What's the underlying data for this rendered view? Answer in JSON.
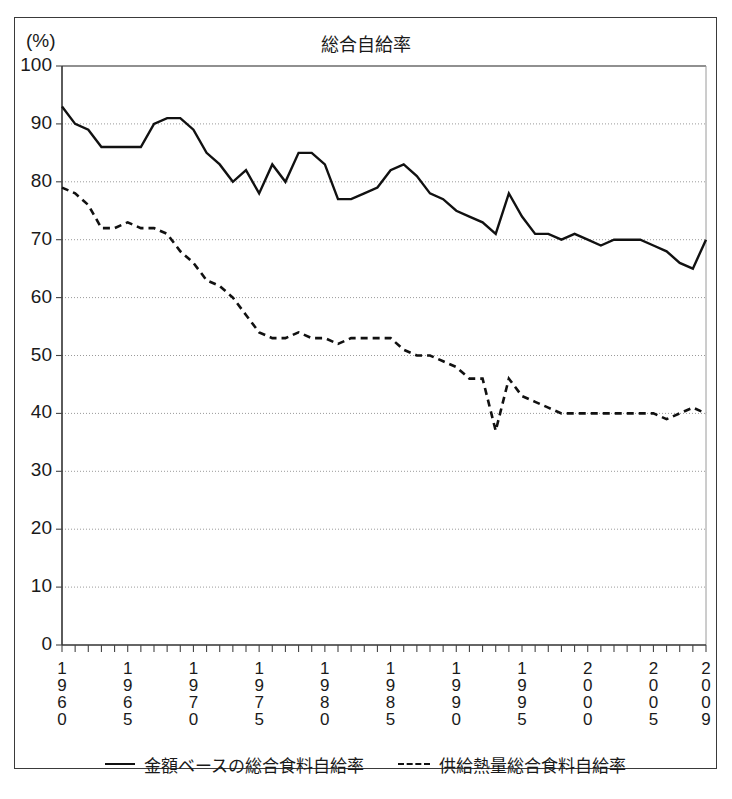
{
  "unit_label": "(%)",
  "title": "総合自給率",
  "legend": [
    {
      "label": "金額ベースの総合食料自給率",
      "style": "solid",
      "name": "legend-value-based"
    },
    {
      "label": "供給熱量総合食料自給率",
      "style": "dashed",
      "name": "legend-calorie-based"
    }
  ],
  "chart_data": {
    "type": "line",
    "title": "総合自給率",
    "xlabel": "",
    "ylabel": "(%)",
    "ylim": [
      0,
      100
    ],
    "xlim": [
      1960,
      2009
    ],
    "yticks": [
      0,
      10,
      20,
      30,
      40,
      50,
      60,
      70,
      80,
      90,
      100
    ],
    "xticks": [
      1960,
      1965,
      1970,
      1975,
      1980,
      1985,
      1990,
      1995,
      2000,
      2005,
      2009
    ],
    "xtick_labels": [
      "1960",
      "1965",
      "1970",
      "1975",
      "1980",
      "1985",
      "1990",
      "1995",
      "2000",
      "2005",
      "2009"
    ],
    "grid": "horizontal-dotted",
    "legend_position": "bottom",
    "x": [
      1960,
      1961,
      1962,
      1963,
      1964,
      1965,
      1966,
      1967,
      1968,
      1969,
      1970,
      1971,
      1972,
      1973,
      1974,
      1975,
      1976,
      1977,
      1978,
      1979,
      1980,
      1981,
      1982,
      1983,
      1984,
      1985,
      1986,
      1987,
      1988,
      1989,
      1990,
      1991,
      1992,
      1993,
      1994,
      1995,
      1996,
      1997,
      1998,
      1999,
      2000,
      2001,
      2002,
      2003,
      2004,
      2005,
      2006,
      2007,
      2008,
      2009
    ],
    "series": [
      {
        "name": "金額ベースの総合食料自給率",
        "style": "solid",
        "values": [
          93,
          90,
          89,
          86,
          86,
          86,
          86,
          90,
          91,
          91,
          89,
          85,
          83,
          80,
          82,
          78,
          83,
          80,
          85,
          85,
          83,
          77,
          77,
          78,
          79,
          82,
          83,
          81,
          78,
          77,
          75,
          74,
          73,
          71,
          78,
          74,
          71,
          71,
          70,
          71,
          70,
          69,
          70,
          70,
          70,
          69,
          68,
          66,
          65,
          70
        ]
      },
      {
        "name": "供給熱量総合食料自給率",
        "style": "dashed",
        "values": [
          79,
          78,
          76,
          72,
          72,
          73,
          72,
          72,
          71,
          68,
          66,
          63,
          62,
          60,
          57,
          54,
          53,
          53,
          54,
          53,
          53,
          52,
          53,
          53,
          53,
          53,
          51,
          50,
          50,
          49,
          48,
          46,
          46,
          37,
          46,
          43,
          42,
          41,
          40,
          40,
          40,
          40,
          40,
          40,
          40,
          40,
          39,
          40,
          41,
          40
        ]
      }
    ]
  }
}
